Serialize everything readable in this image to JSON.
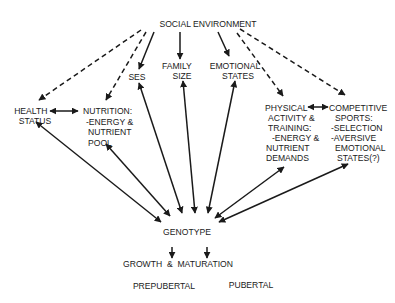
{
  "diagram": {
    "nodes": {
      "social_environment": {
        "lines": [
          "SOCIAL ENVIRONMENT"
        ]
      },
      "health_status": {
        "lines": [
          "HEALTH",
          "STATUS"
        ]
      },
      "nutrition": {
        "lines": [
          "NUTRITION:",
          "-ENERGY &",
          "NUTRIENT",
          "POOL"
        ]
      },
      "ses": {
        "lines": [
          "SES"
        ]
      },
      "family_size": {
        "lines": [
          "FAMILY",
          "SIZE"
        ]
      },
      "emotional_states": {
        "lines": [
          "EMOTIONAL",
          "STATES"
        ]
      },
      "physical_activity": {
        "lines": [
          "PHYSICAL",
          "ACTIVITY &",
          "TRAINING:",
          "-ENERGY &",
          "NUTRIENT",
          "DEMANDS"
        ]
      },
      "competitive_sports": {
        "lines": [
          "COMPETITIVE",
          "SPORTS:",
          "-SELECTION",
          "-AVERSIVE",
          "EMOTIONAL",
          "STATES(?)"
        ]
      },
      "genotype": {
        "lines": [
          "GENOTYPE"
        ]
      },
      "growth_maturation": {
        "lines": [
          "GROWTH  &  MATURATION"
        ]
      },
      "prepubertal": {
        "lines": [
          "PREPUBERTAL"
        ]
      },
      "pubertal": {
        "lines": [
          "PUBERTAL"
        ]
      }
    },
    "edges": [
      {
        "from": "social_environment",
        "to": "health_status",
        "style": "dashed",
        "direction": "forward"
      },
      {
        "from": "social_environment",
        "to": "nutrition",
        "style": "dashed",
        "direction": "forward"
      },
      {
        "from": "social_environment",
        "to": "ses",
        "style": "solid",
        "direction": "forward"
      },
      {
        "from": "social_environment",
        "to": "family_size",
        "style": "solid",
        "direction": "forward"
      },
      {
        "from": "social_environment",
        "to": "emotional_states",
        "style": "solid",
        "direction": "forward"
      },
      {
        "from": "social_environment",
        "to": "physical_activity",
        "style": "dashed",
        "direction": "forward"
      },
      {
        "from": "social_environment",
        "to": "competitive_sports",
        "style": "dashed",
        "direction": "forward"
      },
      {
        "from": "health_status",
        "to": "nutrition",
        "style": "solid",
        "direction": "both"
      },
      {
        "from": "physical_activity",
        "to": "competitive_sports",
        "style": "solid",
        "direction": "both"
      },
      {
        "from": "health_status",
        "to": "genotype",
        "style": "solid",
        "direction": "both"
      },
      {
        "from": "nutrition",
        "to": "genotype",
        "style": "solid",
        "direction": "both"
      },
      {
        "from": "ses",
        "to": "genotype",
        "style": "solid",
        "direction": "both"
      },
      {
        "from": "family_size",
        "to": "genotype",
        "style": "solid",
        "direction": "both"
      },
      {
        "from": "emotional_states",
        "to": "genotype",
        "style": "solid",
        "direction": "both"
      },
      {
        "from": "physical_activity",
        "to": "genotype",
        "style": "solid",
        "direction": "both"
      },
      {
        "from": "competitive_sports",
        "to": "genotype",
        "style": "solid",
        "direction": "both"
      },
      {
        "from": "genotype",
        "to": "growth_maturation",
        "style": "solid",
        "direction": "forward",
        "note": "two arrows"
      }
    ]
  }
}
